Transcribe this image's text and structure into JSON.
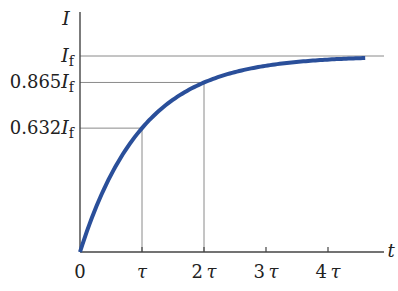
{
  "chart_data": {
    "type": "line",
    "title": "",
    "xlabel": "t",
    "ylabel": "I",
    "x_tick_labels": [
      "0",
      "τ",
      "2τ",
      "3τ",
      "4τ"
    ],
    "x_tick_values": [
      0,
      1,
      2,
      3,
      4
    ],
    "y_reference_labels": [
      {
        "label_num": "",
        "label_var": "I",
        "label_sub": "f",
        "value": 1.0
      },
      {
        "label_num": "0.865",
        "label_var": "I",
        "label_sub": "f",
        "value": 0.865
      },
      {
        "label_num": "0.632",
        "label_var": "I",
        "label_sub": "f",
        "value": 0.632
      }
    ],
    "guides": [
      {
        "x": 1,
        "y": 0.632
      },
      {
        "x": 2,
        "y": 0.865
      }
    ],
    "series": [
      {
        "name": "I(t) = I_f (1 - e^{-t/τ})",
        "formula": "1-exp(-x)",
        "x": [
          0,
          0.5,
          1,
          1.5,
          2,
          2.5,
          3,
          3.5,
          4,
          4.6
        ],
        "values": [
          0,
          0.393,
          0.632,
          0.777,
          0.865,
          0.918,
          0.95,
          0.97,
          0.982,
          0.99
        ]
      }
    ],
    "xlim": [
      0,
      4.9
    ],
    "ylim": [
      0,
      1.0
    ],
    "grid": false,
    "legend": "none",
    "colors": {
      "curve": "#2a4f9a",
      "axis": "#444444",
      "guide": "#8a8a8a"
    }
  }
}
